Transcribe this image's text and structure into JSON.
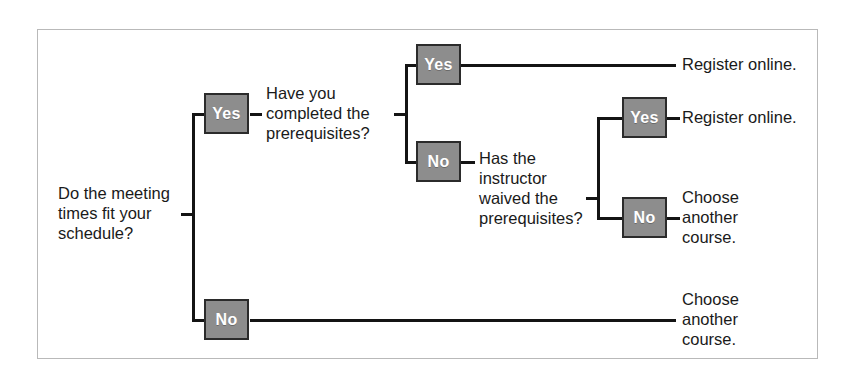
{
  "diagram": {
    "colors": {
      "node_fill": "#8d8d8d",
      "node_border": "#2b2b2b",
      "node_text": "#ffffff",
      "connector": "#141414",
      "frame_border": "#b9b9b9",
      "background": "#ffffff",
      "text": "#1a1a1a"
    },
    "root_question": "Do the meeting\ntimes fit your\nschedule?",
    "questions": {
      "prerequisites": "Have you\ncompleted the\nprerequisites?",
      "waiver": "Has the\ninstructor\nwaived the\nprerequisites?"
    },
    "nodes": {
      "root_yes": "Yes",
      "root_no": "No",
      "prereq_yes": "Yes",
      "prereq_no": "No",
      "waiver_yes": "Yes",
      "waiver_no": "No"
    },
    "outcomes": {
      "register_top": "Register online.",
      "register_mid": "Register online.",
      "choose_another_mid": "Choose\nanother\ncourse.",
      "choose_another_bottom": "Choose\nanother\ncourse."
    }
  }
}
